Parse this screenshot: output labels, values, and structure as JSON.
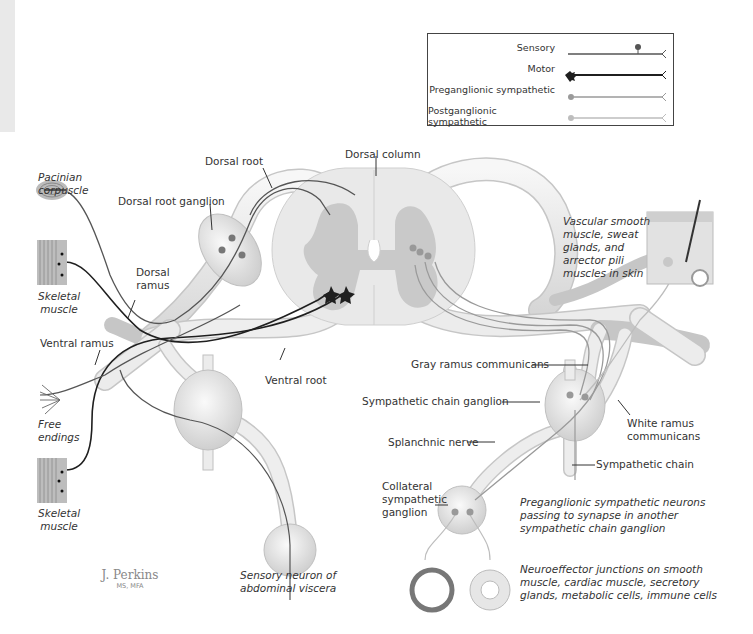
{
  "legend": {
    "items": [
      {
        "label": "Sensory",
        "color": "#555555",
        "style": "line-with-stalked-dot-and-fork"
      },
      {
        "label": "Motor",
        "color": "#222222",
        "style": "bold-line-with-star-and-fork"
      },
      {
        "label": "Preganglionic sympathetic",
        "color": "#9a9a9a",
        "style": "line-with-dot-and-fork"
      },
      {
        "label": "Postganglionic sympathetic",
        "color": "#bdbdbd",
        "style": "line-with-dot-and-fork"
      }
    ]
  },
  "labels": {
    "pacinian_corpuscle": "Pacinian\ncorpuscle",
    "dorsal_root": "Dorsal root",
    "dorsal_root_ganglion": "Dorsal root ganglion",
    "dorsal_column": "Dorsal column",
    "skeletal_muscle_top": "Skeletal\nmuscle",
    "dorsal_ramus": "Dorsal\nramus",
    "ventral_ramus": "Ventral ramus",
    "ventral_root": "Ventral root",
    "free_endings": "Free\nendings",
    "skeletal_muscle_bottom": "Skeletal\nmuscle",
    "sensory_neuron_viscera": "Sensory neuron of\nabdominal viscera",
    "vascular_smooth_muscle": "Vascular smooth\nmuscle, sweat\nglands, and\narrector pili\nmuscles in skin",
    "gray_ramus": "Gray ramus communicans",
    "sympathetic_chain_ganglion": "Sympathetic chain ganglion",
    "white_ramus": "White ramus\ncommunicans",
    "splanchnic_nerve": "Splanchnic nerve",
    "sympathetic_chain": "Sympathetic chain",
    "collateral_ganglion": "Collateral\nsympathetic\nganglion",
    "preganglionic_passing": "Preganglionic sympathetic neurons\npassing to synapse in another\nsympathetic chain ganglion",
    "neuroeffector": "Neuroeffector junctions on smooth\nmuscle, cardiac muscle, secretory\nglands, metabolic cells, immune cells"
  },
  "signature": {
    "name": "J. Perkins",
    "credentials": "MS, MFA"
  },
  "colors": {
    "nerve_fill": "#ececec",
    "nerve_edge": "#c4c4c4",
    "gray_matter": "#c9c9c9",
    "white_matter": "#e8e8e8",
    "sensory": "#555555",
    "motor": "#1f1f1f",
    "pre": "#9a9a9a",
    "post": "#bdbdbd"
  }
}
